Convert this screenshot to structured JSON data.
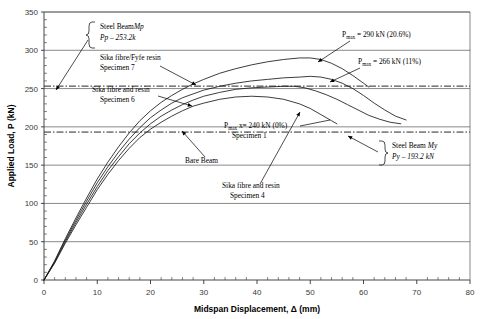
{
  "chart_data": {
    "type": "line",
    "title": "",
    "xlabel": "Midspan Displacement, Δ (mm)",
    "ylabel": "Applied Load, P (kN)",
    "xlim": [
      0,
      80
    ],
    "ylim": [
      0,
      350
    ],
    "xticks": [
      0,
      10,
      20,
      30,
      40,
      50,
      60,
      70,
      80
    ],
    "yticks": [
      0,
      50,
      100,
      150,
      200,
      250,
      300,
      350
    ],
    "xtick_labels": [
      "0",
      "10",
      "20",
      "30",
      "40",
      "50",
      "60",
      "70",
      "80"
    ],
    "ytick_labels": [
      "0",
      "50",
      "100",
      "150",
      "200",
      "250",
      "300",
      "350"
    ],
    "grid": "horizontal",
    "legend_position": "none",
    "reference_lines": [
      {
        "name": "steel-beam-mp",
        "value": 253.2,
        "style": "dash-dot",
        "label": "Steel Beam Mp, Pp - 253.2k"
      },
      {
        "name": "steel-beam-my",
        "value": 193.2,
        "style": "dash-dot",
        "label": "Steel Beam My, Py - 193.2 kN"
      }
    ],
    "series": [
      {
        "name": "Bare Beam (Specimen 1)",
        "pmax": 240,
        "pmax_pct": "0%",
        "points": [
          [
            0,
            0
          ],
          [
            2,
            22
          ],
          [
            4,
            48
          ],
          [
            6,
            72
          ],
          [
            8,
            95
          ],
          [
            10,
            118
          ],
          [
            12,
            138
          ],
          [
            14,
            156
          ],
          [
            16,
            172
          ],
          [
            18,
            186
          ],
          [
            20,
            197
          ],
          [
            22,
            206
          ],
          [
            24,
            214
          ],
          [
            26,
            221
          ],
          [
            28,
            227
          ],
          [
            30,
            231
          ],
          [
            33,
            236
          ],
          [
            36,
            239
          ],
          [
            39,
            240
          ],
          [
            42,
            239
          ],
          [
            45,
            236
          ],
          [
            48,
            230
          ],
          [
            50,
            224
          ],
          [
            52,
            216
          ],
          [
            54,
            208
          ],
          [
            55,
            204
          ]
        ]
      },
      {
        "name": "Sika fibre and resin Specimen 6",
        "pmax": 266,
        "pmax_pct": "11%",
        "points": [
          [
            0,
            0
          ],
          [
            2,
            24
          ],
          [
            4,
            52
          ],
          [
            6,
            78
          ],
          [
            8,
            103
          ],
          [
            10,
            127
          ],
          [
            12,
            148
          ],
          [
            14,
            167
          ],
          [
            16,
            184
          ],
          [
            18,
            199
          ],
          [
            20,
            212
          ],
          [
            22,
            222
          ],
          [
            24,
            231
          ],
          [
            26,
            238
          ],
          [
            28,
            243
          ],
          [
            30,
            248
          ],
          [
            33,
            253
          ],
          [
            36,
            257
          ],
          [
            39,
            260
          ],
          [
            42,
            262
          ],
          [
            45,
            264
          ],
          [
            48,
            265
          ],
          [
            50,
            266
          ],
          [
            52,
            265
          ],
          [
            54,
            262
          ],
          [
            56,
            257
          ],
          [
            58,
            250
          ],
          [
            60,
            241
          ],
          [
            62,
            231
          ],
          [
            64,
            222
          ],
          [
            66,
            214
          ],
          [
            68,
            209
          ]
        ]
      },
      {
        "name": "Sika fibre/Fyfe resin Specimen 7",
        "pmax": 290,
        "pmax_pct": "20.6%",
        "points": [
          [
            0,
            0
          ],
          [
            2,
            25
          ],
          [
            4,
            54
          ],
          [
            6,
            81
          ],
          [
            8,
            107
          ],
          [
            10,
            132
          ],
          [
            12,
            154
          ],
          [
            14,
            174
          ],
          [
            16,
            192
          ],
          [
            18,
            208
          ],
          [
            20,
            221
          ],
          [
            22,
            232
          ],
          [
            24,
            241
          ],
          [
            26,
            249
          ],
          [
            28,
            256
          ],
          [
            30,
            262
          ],
          [
            33,
            270
          ],
          [
            36,
            276
          ],
          [
            39,
            281
          ],
          [
            42,
            285
          ],
          [
            45,
            288
          ],
          [
            48,
            290
          ],
          [
            50,
            290
          ],
          [
            52,
            288
          ],
          [
            54,
            283
          ],
          [
            56,
            276
          ],
          [
            58,
            267
          ],
          [
            60,
            257
          ],
          [
            61,
            252
          ]
        ]
      },
      {
        "name": "Sika fibre and resin Specimen 4",
        "pmax": 253,
        "pmax_pct": "",
        "points": [
          [
            0,
            0
          ],
          [
            2,
            23
          ],
          [
            4,
            50
          ],
          [
            6,
            75
          ],
          [
            8,
            99
          ],
          [
            10,
            122
          ],
          [
            12,
            143
          ],
          [
            14,
            161
          ],
          [
            16,
            178
          ],
          [
            18,
            192
          ],
          [
            20,
            204
          ],
          [
            22,
            214
          ],
          [
            24,
            222
          ],
          [
            26,
            229
          ],
          [
            28,
            235
          ],
          [
            30,
            240
          ],
          [
            33,
            245
          ],
          [
            36,
            249
          ],
          [
            39,
            251
          ],
          [
            42,
            252
          ],
          [
            45,
            253
          ],
          [
            47,
            253
          ],
          [
            49,
            251
          ],
          [
            51,
            247
          ],
          [
            53,
            242
          ],
          [
            55,
            236
          ],
          [
            57,
            229
          ],
          [
            59,
            222
          ],
          [
            61,
            215
          ],
          [
            63,
            210
          ],
          [
            65,
            206
          ],
          [
            67,
            204
          ]
        ]
      }
    ]
  },
  "annotations": {
    "steel_beam_mp_line1": "Steel Beam",
    "steel_beam_mp_line1_italic": "Mp",
    "steel_beam_mp_line2_italic": "Pp – 253.2k",
    "sika_fyfe_line1": "Sika fibre/Fyfe resin",
    "sika_fyfe_line2": "Specimen 7",
    "sika_resin6_line1": "Sika fibre and resin",
    "sika_resin6_line2": "Specimen 6",
    "pmax_290": "= 290 kN (20.6%)",
    "pmax_266": "= 266 kN (11%)",
    "pmax_240": "x= 240 kN (0%)",
    "pmax_240_line2": "Specimen 1",
    "pmax_symbol": "P",
    "pmax_sub": "max",
    "bare_beam": "Bare Beam",
    "sika_resin4_line1": "Sika fibre and resin",
    "sika_resin4_line2": "Specimen 4",
    "steel_beam_my_line1": "Steel Beam",
    "steel_beam_my_line1_italic": "My",
    "steel_beam_my_line2_italic": "Py – 193.2 kN"
  },
  "colors": {
    "curve": "#1a1a1a",
    "grid": "#555555",
    "axis": "#333333",
    "text": "#000000"
  }
}
